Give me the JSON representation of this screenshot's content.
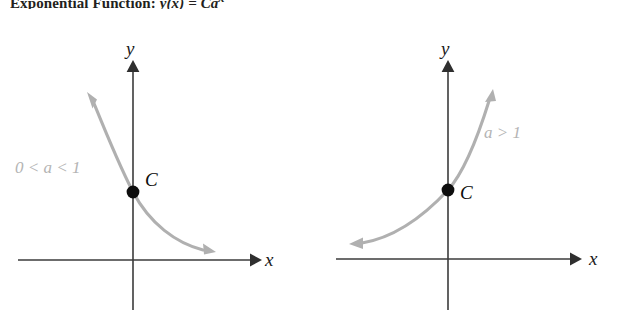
{
  "figure": {
    "heading": "Exponential Function: ",
    "heading_equation": "y(x) = Ca",
    "heading_exponent": "x",
    "background_color": "#ffffff",
    "curve_color": "#b0b0b0",
    "axis_color": "#3b3b3b",
    "point_color": "#0d0d0d",
    "label_color": "#b4b4b4"
  },
  "panels": [
    {
      "id": "decay",
      "condition_label": "0 < a < 1",
      "x_axis_label": "x",
      "y_axis_label": "y",
      "point_label": "C",
      "curve_type": "exponential-decay",
      "description": "Decreasing exponential curve crossing the y-axis at C"
    },
    {
      "id": "growth",
      "condition_label": "a > 1",
      "x_axis_label": "x",
      "y_axis_label": "y",
      "point_label": "C",
      "curve_type": "exponential-growth",
      "description": "Increasing exponential curve crossing the y-axis at C"
    }
  ]
}
